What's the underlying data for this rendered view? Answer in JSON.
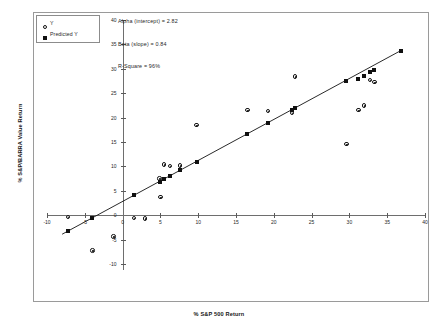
{
  "chart_data": {
    "type": "scatter",
    "title": "",
    "xlabel": "% S&P 500 Return",
    "ylabel": "% S&P/BARRA Value Return",
    "xlim": [
      -10,
      40
    ],
    "ylim": [
      -10,
      40
    ],
    "xticks": [
      -10,
      -5,
      0,
      5,
      10,
      15,
      20,
      25,
      30,
      35,
      40
    ],
    "yticks": [
      -10,
      -5,
      0,
      5,
      10,
      15,
      20,
      25,
      30,
      35,
      40
    ],
    "grid": false,
    "legend_position": "top-left",
    "series": [
      {
        "name": "Y",
        "marker": "open-circle",
        "points": [
          [
            -7.2,
            -0.4
          ],
          [
            -4.0,
            -7.2
          ],
          [
            -1.2,
            -4.4
          ],
          [
            1.5,
            -0.6
          ],
          [
            3.0,
            -0.7
          ],
          [
            4.9,
            7.5
          ],
          [
            5.0,
            3.7
          ],
          [
            5.5,
            10.4
          ],
          [
            6.3,
            10.1
          ],
          [
            7.6,
            10.2
          ],
          [
            9.8,
            18.5
          ],
          [
            16.5,
            21.5
          ],
          [
            19.2,
            21.4
          ],
          [
            22.4,
            21.0
          ],
          [
            22.8,
            28.4
          ],
          [
            29.6,
            14.6
          ],
          [
            31.2,
            21.6
          ],
          [
            31.9,
            22.5
          ],
          [
            32.7,
            27.7
          ],
          [
            33.3,
            27.3
          ]
        ]
      },
      {
        "name": "Predicted Y",
        "marker": "filled-square",
        "points": [
          [
            -7.2,
            -3.2
          ],
          [
            -4.0,
            -0.6
          ],
          [
            1.5,
            4.1
          ],
          [
            4.9,
            6.9
          ],
          [
            5.5,
            7.4
          ],
          [
            6.3,
            8.1
          ],
          [
            7.6,
            9.2
          ],
          [
            9.8,
            11.0
          ],
          [
            16.5,
            16.6
          ],
          [
            19.2,
            18.9
          ],
          [
            22.4,
            21.6
          ],
          [
            22.8,
            21.9
          ],
          [
            29.6,
            27.6
          ],
          [
            31.2,
            28.0
          ],
          [
            31.9,
            28.6
          ],
          [
            32.7,
            29.3
          ],
          [
            33.3,
            29.8
          ],
          [
            36.8,
            33.7
          ]
        ]
      }
    ],
    "fit_line": {
      "name": "Predicted Y",
      "intercept": 2.82,
      "slope": 0.84,
      "x_start": -8.0,
      "x_end": 37.0
    },
    "annotations": [
      "Alpha (intercept) = 2.82",
      "Beta (slope) = 0.84",
      "R-Square = 96%"
    ],
    "stats": {
      "alpha_label": "Alpha (intercept) = 2.82",
      "beta_label": "Beta (slope) = 0.84",
      "r_square_label": "R-Square = 96%"
    },
    "legend": {
      "items": [
        {
          "label": "Y",
          "marker": "open-circle"
        },
        {
          "label": "Predicted Y",
          "marker": "filled-square"
        }
      ]
    },
    "colors": {
      "observed_marker": "#141414",
      "predicted_marker": "#101010",
      "axis": "#6e6e6e",
      "frame": "#9a9a9a",
      "background": "#ffffff"
    }
  }
}
